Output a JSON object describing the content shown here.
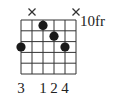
{
  "chord": {
    "position_label": "10fr",
    "strings": 6,
    "frets": 5,
    "muted_strings": [
      2,
      6
    ],
    "dots": [
      {
        "string": 1,
        "fret": 3
      },
      {
        "string": 3,
        "fret": 1
      },
      {
        "string": 4,
        "fret": 2
      },
      {
        "string": 5,
        "fret": 3
      }
    ],
    "fingers": [
      "3",
      "",
      "1",
      "2",
      "4",
      ""
    ],
    "colors": {
      "line": "#333333",
      "dot": "#1a1a1a",
      "text": "#222222"
    }
  }
}
